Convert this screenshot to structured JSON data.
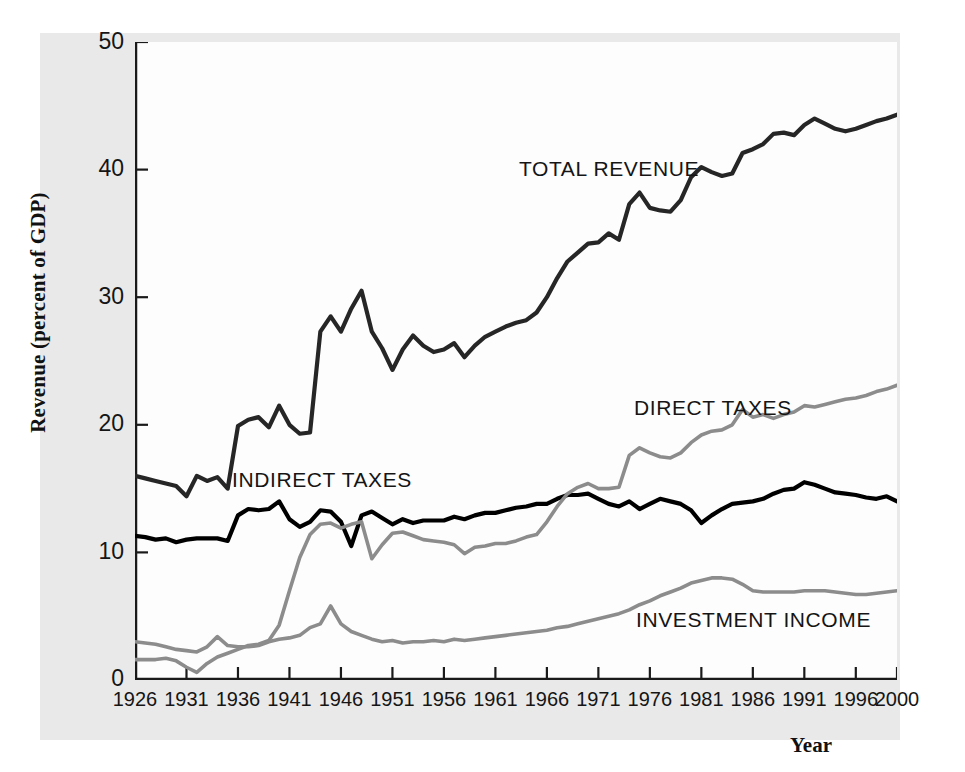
{
  "figure": {
    "colors": {
      "paper_background": "#e9e9e9",
      "plot_background": "#fdfdfd",
      "axis": "#1a1a1a",
      "total_revenue": "#262626",
      "indirect_taxes": "#000000",
      "direct_taxes": "#8c8c8c",
      "investment_income": "#8c8c8c"
    }
  },
  "axes": {
    "y_title": "Revenue (percent of GDP)",
    "x_title": "Year",
    "y_ticks": [
      "0",
      "10",
      "20",
      "30",
      "40",
      "50"
    ],
    "x_ticks": [
      "1926",
      "1931",
      "1936",
      "1941",
      "1946",
      "1951",
      "1956",
      "1961",
      "1966",
      "1971",
      "1976",
      "1981",
      "1986",
      "1991",
      "1996",
      "2000"
    ]
  },
  "annotations": {
    "total_revenue": "TOTAL REVENUE",
    "indirect_taxes": "INDIRECT TAXES",
    "direct_taxes": "DIRECT TAXES",
    "investment_income": "INVESTMENT INCOME"
  },
  "chart_data": {
    "type": "line",
    "title": "",
    "xlabel": "Year",
    "ylabel": "Revenue (percent of GDP)",
    "xlim": [
      1926,
      2000
    ],
    "ylim": [
      0,
      50
    ],
    "grid": false,
    "legend": "inline-annotations",
    "x": [
      1926,
      1927,
      1928,
      1929,
      1930,
      1931,
      1932,
      1933,
      1934,
      1935,
      1936,
      1937,
      1938,
      1939,
      1940,
      1941,
      1942,
      1943,
      1944,
      1945,
      1946,
      1947,
      1948,
      1949,
      1950,
      1951,
      1952,
      1953,
      1954,
      1955,
      1956,
      1957,
      1958,
      1959,
      1960,
      1961,
      1962,
      1963,
      1964,
      1965,
      1966,
      1967,
      1968,
      1969,
      1970,
      1971,
      1972,
      1973,
      1974,
      1975,
      1976,
      1977,
      1978,
      1979,
      1980,
      1981,
      1982,
      1983,
      1984,
      1985,
      1986,
      1987,
      1988,
      1989,
      1990,
      1991,
      1992,
      1993,
      1994,
      1995,
      1996,
      1997,
      1998,
      1999,
      2000
    ],
    "series": [
      {
        "name": "TOTAL REVENUE",
        "color": "#262626",
        "values": [
          16.0,
          15.8,
          15.6,
          15.4,
          15.2,
          14.4,
          16.0,
          15.6,
          15.9,
          15.0,
          19.9,
          20.4,
          20.6,
          19.8,
          21.5,
          20.0,
          19.3,
          19.4,
          27.3,
          28.5,
          27.3,
          29.1,
          30.5,
          27.3,
          26.0,
          24.3,
          25.9,
          27.0,
          26.2,
          25.7,
          25.9,
          26.4,
          25.3,
          26.2,
          26.9,
          27.3,
          27.7,
          28.0,
          28.2,
          28.8,
          30.0,
          31.5,
          32.8,
          33.5,
          34.2,
          34.3,
          35.0,
          34.5,
          37.3,
          38.2,
          37.0,
          36.8,
          36.7,
          37.6,
          39.4,
          40.2,
          39.8,
          39.5,
          39.7,
          41.3,
          41.6,
          42.0,
          42.8,
          42.9,
          42.7,
          43.5,
          44.0,
          43.6,
          43.2,
          43.0,
          43.2,
          43.5,
          43.8,
          44.0,
          44.3
        ]
      },
      {
        "name": "INDIRECT TAXES",
        "color": "#000000",
        "values": [
          11.3,
          11.2,
          11.0,
          11.1,
          10.8,
          11.0,
          11.1,
          11.1,
          11.1,
          10.9,
          12.9,
          13.4,
          13.3,
          13.4,
          14.0,
          12.6,
          12.0,
          12.4,
          13.3,
          13.2,
          12.4,
          10.5,
          12.9,
          13.2,
          12.7,
          12.2,
          12.6,
          12.3,
          12.5,
          12.5,
          12.5,
          12.8,
          12.6,
          12.9,
          13.1,
          13.1,
          13.3,
          13.5,
          13.6,
          13.8,
          13.8,
          14.2,
          14.5,
          14.5,
          14.6,
          14.2,
          13.8,
          13.6,
          14.0,
          13.4,
          13.8,
          14.2,
          14.0,
          13.8,
          13.3,
          12.3,
          12.9,
          13.4,
          13.8,
          13.9,
          14.0,
          14.2,
          14.6,
          14.9,
          15.0,
          15.5,
          15.3,
          15.0,
          14.7,
          14.6,
          14.5,
          14.3,
          14.2,
          14.4,
          14.0
        ]
      },
      {
        "name": "DIRECT TAXES",
        "color": "#8c8c8c",
        "values": [
          1.6,
          1.6,
          1.6,
          1.7,
          1.5,
          1.0,
          0.6,
          1.3,
          1.8,
          2.1,
          2.4,
          2.7,
          2.8,
          3.1,
          4.3,
          7.0,
          9.6,
          11.4,
          12.2,
          12.3,
          11.9,
          12.2,
          12.4,
          9.5,
          10.6,
          11.5,
          11.6,
          11.3,
          11.0,
          10.9,
          10.8,
          10.6,
          9.9,
          10.4,
          10.5,
          10.7,
          10.7,
          10.9,
          11.2,
          11.4,
          12.4,
          13.6,
          14.6,
          15.1,
          15.4,
          15.0,
          15.0,
          15.1,
          17.6,
          18.2,
          17.8,
          17.5,
          17.4,
          17.8,
          18.6,
          19.2,
          19.5,
          19.6,
          20.0,
          21.2,
          20.6,
          20.8,
          20.5,
          20.8,
          21.0,
          21.5,
          21.4,
          21.6,
          21.8,
          22.0,
          22.1,
          22.3,
          22.6,
          22.8,
          23.1
        ]
      },
      {
        "name": "INVESTMENT INCOME",
        "color": "#8c8c8c",
        "values": [
          3.0,
          2.9,
          2.8,
          2.6,
          2.4,
          2.3,
          2.2,
          2.6,
          3.4,
          2.7,
          2.6,
          2.6,
          2.7,
          3.0,
          3.2,
          3.3,
          3.5,
          4.1,
          4.4,
          5.8,
          4.4,
          3.8,
          3.5,
          3.2,
          3.0,
          3.1,
          2.9,
          3.0,
          3.0,
          3.1,
          3.0,
          3.2,
          3.1,
          3.2,
          3.3,
          3.4,
          3.5,
          3.6,
          3.7,
          3.8,
          3.9,
          4.1,
          4.2,
          4.4,
          4.6,
          4.8,
          5.0,
          5.2,
          5.5,
          5.9,
          6.2,
          6.6,
          6.9,
          7.2,
          7.6,
          7.8,
          8.0,
          8.0,
          7.9,
          7.5,
          7.0,
          6.9,
          6.9,
          6.9,
          6.9,
          7.0,
          7.0,
          7.0,
          6.9,
          6.8,
          6.7,
          6.7,
          6.8,
          6.9,
          7.0
        ]
      }
    ]
  }
}
